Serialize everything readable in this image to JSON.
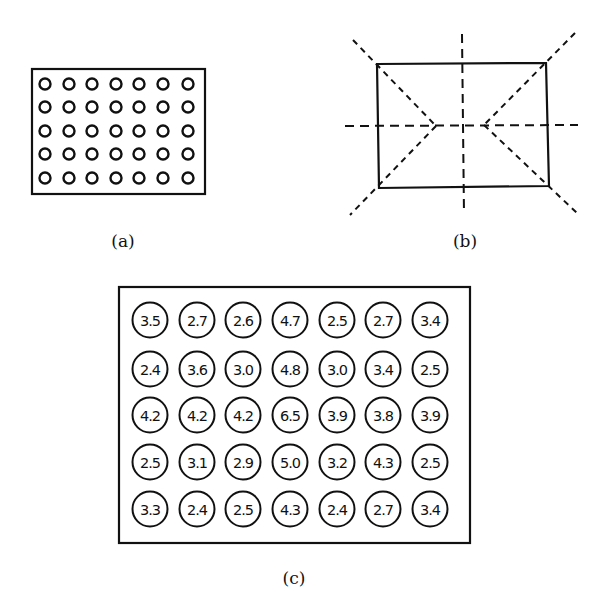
{
  "panels": {
    "a": {
      "label": "(a)",
      "rows": 5,
      "cols": 7
    },
    "b": {
      "label": "(b)"
    },
    "c": {
      "label": "(c)",
      "values": [
        [
          "3.5",
          "2.7",
          "2.6",
          "4.7",
          "2.5",
          "2.7",
          "3.4"
        ],
        [
          "2.4",
          "3.6",
          "3.0",
          "4.8",
          "3.0",
          "3.4",
          "2.5"
        ],
        [
          "4.2",
          "4.2",
          "4.2",
          "6.5",
          "3.9",
          "3.8",
          "3.9"
        ],
        [
          "2.5",
          "3.1",
          "2.9",
          "5.0",
          "3.2",
          "4.3",
          "2.5"
        ],
        [
          "3.3",
          "2.4",
          "2.5",
          "4.3",
          "2.4",
          "2.7",
          "3.4"
        ]
      ]
    }
  }
}
